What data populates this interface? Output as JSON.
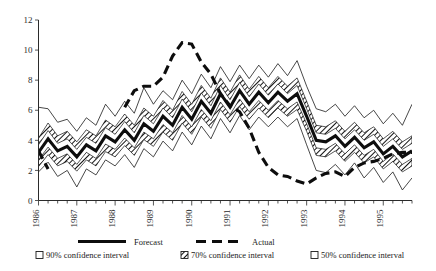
{
  "chart_data": {
    "type": "area",
    "title": "",
    "subtitle": "",
    "xlabel": "",
    "ylabel": "",
    "ylim": [
      0,
      12
    ],
    "xlim": [
      1986.0,
      1995.75
    ],
    "yticks": [
      0,
      2,
      4,
      6,
      8,
      10,
      12
    ],
    "ytick_labels": [
      "0",
      "2",
      "4",
      "6",
      "8",
      "10",
      "12"
    ],
    "xtick_labels": [
      "1986",
      "1987",
      "1988",
      "1989",
      "1990",
      "1991",
      "1992",
      "1993",
      "1994",
      "1995"
    ],
    "grid": false,
    "legend_position": "bottom",
    "minor_ticks_per_year": 4,
    "x": [
      1986.0,
      1986.25,
      1986.5,
      1986.75,
      1987.0,
      1987.25,
      1987.5,
      1987.75,
      1988.0,
      1988.25,
      1988.5,
      1988.75,
      1989.0,
      1989.25,
      1989.5,
      1989.75,
      1990.0,
      1990.25,
      1990.5,
      1990.75,
      1991.0,
      1991.25,
      1991.5,
      1991.75,
      1992.0,
      1992.25,
      1992.5,
      1992.75,
      1993.0,
      1993.25,
      1993.5,
      1993.75,
      1994.0,
      1994.25,
      1994.5,
      1994.75,
      1995.0,
      1995.25,
      1995.5,
      1995.75
    ],
    "series": [
      {
        "name": "Forecast",
        "role": "central",
        "style": "solid-thick",
        "values": [
          3.2,
          4.1,
          3.3,
          3.6,
          2.9,
          3.7,
          3.3,
          4.3,
          3.9,
          4.7,
          4.0,
          5.1,
          4.6,
          5.6,
          5.0,
          6.2,
          5.4,
          6.6,
          5.8,
          7.1,
          6.2,
          7.3,
          6.4,
          7.2,
          6.5,
          7.2,
          6.6,
          7.1,
          5.6,
          4.0,
          3.9,
          4.3,
          3.6,
          4.2,
          3.5,
          3.9,
          3.1,
          3.6,
          2.9,
          3.3
        ]
      },
      {
        "name": "Actual",
        "role": "actual",
        "style": "dashed-thick",
        "values": [
          3.3,
          2.1,
          null,
          null,
          null,
          null,
          null,
          null,
          null,
          6.2,
          7.3,
          7.6,
          7.6,
          8.2,
          9.6,
          10.5,
          10.4,
          9.2,
          8.4,
          7.1,
          6.3,
          5.9,
          4.8,
          3.2,
          2.2,
          1.7,
          1.6,
          1.3,
          1.1,
          1.5,
          1.8,
          1.9,
          1.6,
          2.2,
          2.5,
          2.6,
          2.8,
          3.1,
          3.2,
          3.2
        ]
      }
    ],
    "bands": [
      {
        "name": "50% confidence interval",
        "level": 50,
        "fill": "white",
        "lower": [
          2.7,
          3.55,
          2.8,
          3.1,
          2.4,
          3.2,
          2.8,
          3.75,
          3.4,
          4.15,
          3.5,
          4.55,
          4.1,
          5.05,
          4.5,
          5.65,
          4.9,
          6.05,
          5.3,
          6.55,
          5.7,
          6.75,
          5.9,
          6.65,
          6.0,
          6.65,
          6.1,
          6.55,
          5.1,
          3.5,
          3.4,
          3.8,
          3.1,
          3.7,
          3.0,
          3.4,
          2.6,
          3.1,
          2.4,
          2.8
        ],
        "upper": [
          3.7,
          4.65,
          3.8,
          4.1,
          3.4,
          4.2,
          3.8,
          4.85,
          4.4,
          5.25,
          4.5,
          5.65,
          5.1,
          6.15,
          5.5,
          6.75,
          5.9,
          7.15,
          6.3,
          7.65,
          6.7,
          7.85,
          6.9,
          7.75,
          7.0,
          7.75,
          7.1,
          7.65,
          6.1,
          4.5,
          4.4,
          4.8,
          4.1,
          4.7,
          4.0,
          4.4,
          3.6,
          4.1,
          3.4,
          3.8
        ]
      },
      {
        "name": "70% confidence interval",
        "level": 70,
        "fill": "hatched",
        "lower": [
          2.25,
          3.05,
          2.3,
          2.6,
          1.95,
          2.7,
          2.3,
          3.25,
          2.9,
          3.65,
          3.0,
          4.05,
          3.6,
          4.55,
          4.0,
          5.15,
          4.4,
          5.55,
          4.8,
          6.05,
          5.2,
          6.25,
          5.4,
          6.15,
          5.5,
          6.15,
          5.6,
          6.05,
          4.6,
          3.0,
          2.9,
          3.3,
          2.6,
          3.2,
          2.5,
          2.9,
          2.1,
          2.6,
          1.9,
          2.3
        ],
        "upper": [
          4.15,
          5.15,
          4.3,
          4.6,
          3.9,
          4.7,
          4.3,
          5.35,
          4.9,
          5.75,
          5.0,
          6.15,
          5.6,
          6.65,
          6.0,
          7.25,
          6.4,
          7.65,
          6.8,
          8.15,
          7.2,
          8.35,
          7.4,
          8.25,
          7.5,
          8.25,
          7.6,
          8.15,
          6.6,
          5.0,
          4.9,
          5.3,
          4.6,
          5.2,
          4.5,
          4.9,
          4.1,
          4.6,
          3.9,
          4.3
        ]
      },
      {
        "name": "90% confidence interval",
        "level": 90,
        "fill": "white",
        "lower": [
          1.9,
          2.55,
          1.6,
          2.0,
          0.9,
          2.1,
          1.7,
          2.7,
          2.3,
          3.05,
          2.2,
          3.45,
          2.9,
          3.95,
          3.3,
          4.55,
          3.7,
          4.95,
          4.1,
          5.45,
          4.5,
          5.65,
          4.7,
          5.55,
          4.9,
          5.55,
          4.9,
          5.45,
          3.7,
          2.0,
          1.85,
          2.4,
          1.7,
          2.5,
          1.5,
          2.2,
          1.2,
          1.9,
          0.7,
          1.5
        ],
        "upper": [
          6.2,
          6.1,
          5.2,
          5.4,
          4.6,
          5.5,
          5.0,
          6.4,
          5.6,
          6.6,
          5.8,
          7.5,
          6.4,
          7.3,
          6.7,
          8.0,
          7.1,
          8.4,
          7.5,
          8.9,
          7.9,
          9.0,
          8.1,
          9.0,
          8.2,
          9.1,
          8.3,
          9.3,
          7.6,
          6.1,
          5.9,
          6.4,
          5.6,
          6.3,
          5.5,
          6.0,
          5.1,
          5.8,
          5.0,
          6.4
        ]
      }
    ],
    "legend": [
      {
        "label": "Forecast",
        "marker": "solid-line"
      },
      {
        "label": "Actual",
        "marker": "dashed-line"
      },
      {
        "label": "90% confidence interval",
        "marker": "open-square"
      },
      {
        "label": "70% confidence interval",
        "marker": "hatched-square"
      },
      {
        "label": "50% confidence interval",
        "marker": "open-square"
      }
    ]
  }
}
